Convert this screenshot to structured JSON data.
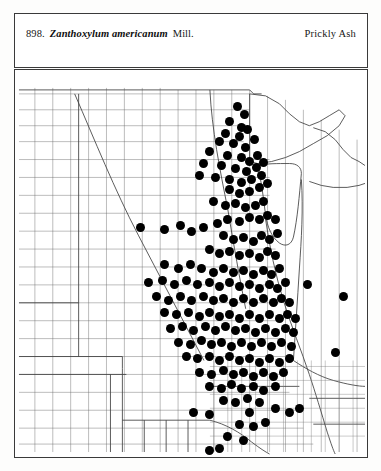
{
  "header": {
    "entry_number": "898.",
    "scientific_name": "Zanthoxylum americanum",
    "authority": "Mill.",
    "common_name": "Prickly Ash"
  },
  "map": {
    "kind": "county-dot-distribution-map",
    "region_description": "Great Plains and Midwestern United States with county boundaries",
    "dot_color": "#000000",
    "boundary_color": "#555555",
    "frame_color": "#3a3a3a",
    "background_color": "#ffffff",
    "dot_diameter_px": 9
  },
  "chart_data": {
    "type": "scatter",
    "xlabel": "",
    "ylabel": "",
    "xlim": [
      0,
      354
    ],
    "ylim": [
      0,
      389
    ],
    "grid": false,
    "legend": null,
    "series": [
      {
        "name": "County occurrence records",
        "marker": "filled-circle",
        "color": "#000000",
        "size": 9,
        "points": [
          [
            224,
            37
          ],
          [
            231,
            45
          ],
          [
            216,
            52
          ],
          [
            228,
            58
          ],
          [
            212,
            64
          ],
          [
            226,
            67
          ],
          [
            234,
            60
          ],
          [
            206,
            72
          ],
          [
            220,
            74
          ],
          [
            232,
            78
          ],
          [
            241,
            70
          ],
          [
            196,
            82
          ],
          [
            214,
            86
          ],
          [
            228,
            88
          ],
          [
            236,
            92
          ],
          [
            244,
            86
          ],
          [
            190,
            94
          ],
          [
            208,
            96
          ],
          [
            222,
            99
          ],
          [
            233,
            102
          ],
          [
            243,
            98
          ],
          [
            250,
            93
          ],
          [
            186,
            106
          ],
          [
            202,
            108
          ],
          [
            216,
            110
          ],
          [
            228,
            113
          ],
          [
            238,
            110
          ],
          [
            248,
            106
          ],
          [
            216,
            120
          ],
          [
            226,
            124
          ],
          [
            236,
            122
          ],
          [
            246,
            118
          ],
          [
            254,
            114
          ],
          [
            200,
            132
          ],
          [
            212,
            136
          ],
          [
            222,
            134
          ],
          [
            232,
            138
          ],
          [
            242,
            136
          ],
          [
            250,
            132
          ],
          [
            126,
            158
          ],
          [
            150,
            160
          ],
          [
            166,
            156
          ],
          [
            178,
            162
          ],
          [
            190,
            158
          ],
          [
            204,
            154
          ],
          [
            214,
            150
          ],
          [
            226,
            152
          ],
          [
            236,
            148
          ],
          [
            246,
            150
          ],
          [
            254,
            146
          ],
          [
            262,
            150
          ],
          [
            210,
            166
          ],
          [
            220,
            170
          ],
          [
            230,
            168
          ],
          [
            240,
            172
          ],
          [
            248,
            166
          ],
          [
            256,
            170
          ],
          [
            264,
            164
          ],
          [
            196,
            180
          ],
          [
            206,
            184
          ],
          [
            216,
            182
          ],
          [
            226,
            186
          ],
          [
            236,
            184
          ],
          [
            246,
            188
          ],
          [
            254,
            182
          ],
          [
            262,
            186
          ],
          [
            150,
            196
          ],
          [
            164,
            200
          ],
          [
            176,
            196
          ],
          [
            188,
            200
          ],
          [
            200,
            204
          ],
          [
            210,
            200
          ],
          [
            220,
            204
          ],
          [
            230,
            202
          ],
          [
            240,
            206
          ],
          [
            250,
            202
          ],
          [
            258,
            206
          ],
          [
            266,
            200
          ],
          [
            134,
            214
          ],
          [
            148,
            212
          ],
          [
            160,
            216
          ],
          [
            172,
            212
          ],
          [
            184,
            216
          ],
          [
            196,
            214
          ],
          [
            206,
            218
          ],
          [
            216,
            214
          ],
          [
            226,
            218
          ],
          [
            236,
            216
          ],
          [
            246,
            220
          ],
          [
            256,
            216
          ],
          [
            264,
            220
          ],
          [
            272,
            214
          ],
          [
            142,
            228
          ],
          [
            154,
            232
          ],
          [
            166,
            228
          ],
          [
            178,
            232
          ],
          [
            190,
            228
          ],
          [
            200,
            232
          ],
          [
            210,
            230
          ],
          [
            220,
            234
          ],
          [
            230,
            230
          ],
          [
            240,
            234
          ],
          [
            250,
            230
          ],
          [
            260,
            234
          ],
          [
            268,
            230
          ],
          [
            276,
            234
          ],
          [
            150,
            244
          ],
          [
            162,
            246
          ],
          [
            174,
            244
          ],
          [
            186,
            248
          ],
          [
            196,
            244
          ],
          [
            206,
            248
          ],
          [
            216,
            246
          ],
          [
            226,
            250
          ],
          [
            236,
            246
          ],
          [
            246,
            250
          ],
          [
            256,
            246
          ],
          [
            266,
            250
          ],
          [
            274,
            246
          ],
          [
            282,
            250
          ],
          [
            156,
            260
          ],
          [
            168,
            258
          ],
          [
            180,
            262
          ],
          [
            192,
            258
          ],
          [
            202,
            262
          ],
          [
            212,
            258
          ],
          [
            222,
            262
          ],
          [
            232,
            260
          ],
          [
            242,
            264
          ],
          [
            252,
            260
          ],
          [
            262,
            264
          ],
          [
            272,
            260
          ],
          [
            280,
            264
          ],
          [
            164,
            274
          ],
          [
            176,
            276
          ],
          [
            188,
            272
          ],
          [
            198,
            276
          ],
          [
            208,
            274
          ],
          [
            218,
            278
          ],
          [
            228,
            274
          ],
          [
            238,
            278
          ],
          [
            248,
            274
          ],
          [
            258,
            278
          ],
          [
            268,
            274
          ],
          [
            278,
            278
          ],
          [
            172,
            288
          ],
          [
            184,
            290
          ],
          [
            196,
            288
          ],
          [
            206,
            292
          ],
          [
            216,
            288
          ],
          [
            226,
            292
          ],
          [
            236,
            290
          ],
          [
            246,
            294
          ],
          [
            256,
            290
          ],
          [
            266,
            294
          ],
          [
            276,
            290
          ],
          [
            186,
            304
          ],
          [
            198,
            306
          ],
          [
            210,
            302
          ],
          [
            220,
            306
          ],
          [
            230,
            304
          ],
          [
            240,
            308
          ],
          [
            250,
            304
          ],
          [
            260,
            308
          ],
          [
            270,
            304
          ],
          [
            196,
            318
          ],
          [
            208,
            320
          ],
          [
            218,
            316
          ],
          [
            228,
            320
          ],
          [
            240,
            318
          ],
          [
            250,
            322
          ],
          [
            262,
            318
          ],
          [
            210,
            332
          ],
          [
            222,
            334
          ],
          [
            234,
            330
          ],
          [
            246,
            334
          ],
          [
            294,
            216
          ],
          [
            330,
            228
          ],
          [
            322,
            284
          ],
          [
            196,
            346
          ],
          [
            236,
            344
          ],
          [
            262,
            340
          ],
          [
            276,
            344
          ],
          [
            286,
            340
          ],
          [
            226,
            356
          ],
          [
            240,
            358
          ],
          [
            252,
            354
          ],
          [
            214,
            368
          ],
          [
            230,
            372
          ],
          [
            196,
            382
          ],
          [
            206,
            380
          ],
          [
            190,
            394
          ],
          [
            200,
            398
          ],
          [
            180,
            344
          ]
        ]
      }
    ]
  }
}
